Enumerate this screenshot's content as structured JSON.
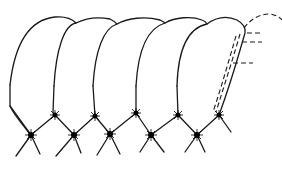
{
  "figure": {
    "type": "line-drawing",
    "segment_count": 5,
    "junction_count": 9,
    "top_right_label": "",
    "dashed_overlay": {
      "on_segment": 5,
      "description": "dashed outline offset from the last segment with three short dashed leader lines"
    },
    "colors": {
      "stroke": "#1a1a1a",
      "background": "#ffffff"
    }
  }
}
